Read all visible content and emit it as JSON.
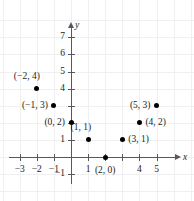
{
  "chart_data": {
    "type": "scatter",
    "title": "",
    "xlabel": "x",
    "ylabel": "y",
    "grid": true,
    "legend": "none",
    "xlim": [
      -3.6,
      6.2
    ],
    "ylim": [
      -1.6,
      7.8
    ],
    "xticks": [
      -3,
      -2,
      -1,
      1,
      2,
      3,
      4,
      5
    ],
    "yticks": [
      1,
      2,
      3,
      4,
      5,
      6,
      7,
      -1
    ],
    "xtick_labels": [
      "-3",
      "-2",
      "-1",
      "1",
      "",
      "",
      "4",
      "5"
    ],
    "ytick_labels": [
      "1",
      "",
      "",
      "4",
      "5",
      "6",
      "7",
      "-1"
    ],
    "points": [
      {
        "x": -2,
        "y": 4,
        "label": "(−2, 4)",
        "label_pos": "above-left"
      },
      {
        "x": -1,
        "y": 3,
        "label": "(−1, 3)",
        "label_pos": "left"
      },
      {
        "x": 0,
        "y": 2,
        "label": "(0, 2)",
        "label_pos": "left"
      },
      {
        "x": 1,
        "y": 1,
        "label": "(1, 1)",
        "label_pos": "above-left"
      },
      {
        "x": 2,
        "y": 0,
        "label": "(2, 0)",
        "label_pos": "below"
      },
      {
        "x": 3,
        "y": 1,
        "label": "(3, 1)",
        "label_pos": "right"
      },
      {
        "x": 4,
        "y": 2,
        "label": "(4, 2)",
        "label_pos": "right"
      },
      {
        "x": 5,
        "y": 3,
        "label": "(5, 3)",
        "label_pos": "left"
      }
    ],
    "colors": {
      "point": "#000000",
      "axis": "#58585a",
      "grid": "#f0f0f2",
      "text": "#231f20",
      "background": "#ffffff"
    }
  },
  "geometry": {
    "origin_x": 71,
    "origin_y": 157,
    "unit_px": 17.1
  }
}
